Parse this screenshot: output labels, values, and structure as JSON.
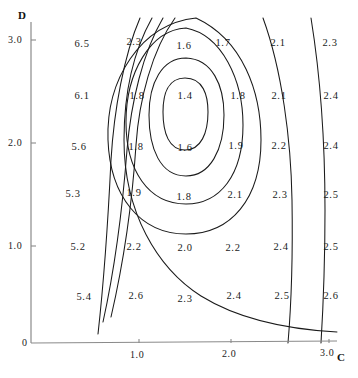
{
  "figure": {
    "type": "contour-plot",
    "background_color": "#ffffff",
    "line_color": "#1a1a1a",
    "axis_color": "#8a8a8a",
    "text_color": "#1b1b1b"
  },
  "axes": {
    "x": {
      "name": "C",
      "name_x": 337,
      "name_y": 352,
      "line": {
        "x1": 31,
        "y1": 343,
        "x2": 337,
        "y2": 341
      },
      "ticks": [
        {
          "label": "1.0",
          "x": 130,
          "y": 350
        },
        {
          "label": "2.0",
          "x": 222,
          "y": 349
        },
        {
          "label": "3.0",
          "x": 320,
          "y": 348
        }
      ]
    },
    "y": {
      "name": "D",
      "name_x": 18,
      "name_y": 10,
      "line": {
        "x1": 31,
        "y1": 22,
        "x2": 31,
        "y2": 343
      },
      "ticks": [
        {
          "label": "3.0",
          "x": 8,
          "y": 35
        },
        {
          "label": "2.0",
          "x": 8,
          "y": 138
        },
        {
          "label": "1.0",
          "x": 8,
          "y": 241
        },
        {
          "label": "0",
          "x": 22,
          "y": 338
        }
      ]
    }
  },
  "chart_data": {
    "type": "contour",
    "title": "",
    "xlabel": "C",
    "ylabel": "D",
    "xlim": [
      0,
      3.1
    ],
    "ylim": [
      0,
      3.1
    ],
    "grid": false,
    "legend": "none",
    "contour_levels": [
      1.4,
      1.6,
      1.8,
      2.0,
      2.3,
      5.2,
      5.6,
      6.1
    ],
    "minimum_value": 1.4,
    "minimum_at": {
      "C": 1.52,
      "D": 2.26
    },
    "value_labels": [
      {
        "text": "6.5",
        "x": 82,
        "y": 44,
        "C": 0.52,
        "D": 2.9
      },
      {
        "text": "2.3",
        "x": 134,
        "y": 42,
        "C": 1.07,
        "D": 2.92
      },
      {
        "text": "1.6",
        "x": 184,
        "y": 46,
        "C": 1.58,
        "D": 2.88
      },
      {
        "text": "1.7",
        "x": 223,
        "y": 43,
        "C": 1.98,
        "D": 2.91
      },
      {
        "text": "2.1",
        "x": 278,
        "y": 43,
        "C": 2.53,
        "D": 2.91
      },
      {
        "text": "2.3",
        "x": 330,
        "y": 43,
        "C": 3.06,
        "D": 2.91
      },
      {
        "text": "6.1",
        "x": 82,
        "y": 96,
        "C": 0.52,
        "D": 2.4
      },
      {
        "text": "1.8",
        "x": 137,
        "y": 96,
        "C": 1.1,
        "D": 2.4
      },
      {
        "text": "1.4",
        "x": 185,
        "y": 96,
        "C": 1.59,
        "D": 2.4
      },
      {
        "text": "1.8",
        "x": 238,
        "y": 96,
        "C": 2.12,
        "D": 2.4
      },
      {
        "text": "2.1",
        "x": 279,
        "y": 96,
        "C": 2.54,
        "D": 2.4
      },
      {
        "text": "2.4",
        "x": 331,
        "y": 96,
        "C": 3.07,
        "D": 2.4
      },
      {
        "text": "5.6",
        "x": 79,
        "y": 147,
        "C": 0.49,
        "D": 1.9
      },
      {
        "text": "1.8",
        "x": 136,
        "y": 147,
        "C": 1.09,
        "D": 1.9
      },
      {
        "text": "1.6",
        "x": 185,
        "y": 148,
        "C": 1.59,
        "D": 1.89
      },
      {
        "text": "1.9",
        "x": 236,
        "y": 146,
        "C": 2.1,
        "D": 1.91
      },
      {
        "text": "2.2",
        "x": 279,
        "y": 146,
        "C": 2.54,
        "D": 1.91
      },
      {
        "text": "2.4",
        "x": 331,
        "y": 146,
        "C": 3.07,
        "D": 1.91
      },
      {
        "text": "5.3",
        "x": 73,
        "y": 194,
        "C": 0.43,
        "D": 1.45
      },
      {
        "text": "1.9",
        "x": 134,
        "y": 193,
        "C": 1.07,
        "D": 1.46
      },
      {
        "text": "1.8",
        "x": 184,
        "y": 197,
        "C": 1.58,
        "D": 1.42
      },
      {
        "text": "2.1",
        "x": 235,
        "y": 195,
        "C": 2.09,
        "D": 1.44
      },
      {
        "text": "2.3",
        "x": 280,
        "y": 195,
        "C": 2.55,
        "D": 1.44
      },
      {
        "text": "2.5",
        "x": 331,
        "y": 195,
        "C": 3.07,
        "D": 1.44
      },
      {
        "text": "5.2",
        "x": 78,
        "y": 247,
        "C": 0.48,
        "D": 0.93
      },
      {
        "text": "2.2",
        "x": 134,
        "y": 247,
        "C": 1.07,
        "D": 0.93
      },
      {
        "text": "2.0",
        "x": 185,
        "y": 248,
        "C": 1.59,
        "D": 0.92
      },
      {
        "text": "2.2",
        "x": 233,
        "y": 248,
        "C": 2.07,
        "D": 0.92
      },
      {
        "text": "2.4",
        "x": 281,
        "y": 247,
        "C": 2.56,
        "D": 0.93
      },
      {
        "text": "2.5",
        "x": 331,
        "y": 247,
        "C": 3.07,
        "D": 0.93
      },
      {
        "text": "5.4",
        "x": 84,
        "y": 297,
        "C": 0.54,
        "D": 0.45
      },
      {
        "text": "2.6",
        "x": 136,
        "y": 296,
        "C": 1.09,
        "D": 0.46
      },
      {
        "text": "2.3",
        "x": 185,
        "y": 299,
        "C": 1.59,
        "D": 0.43
      },
      {
        "text": "2.4",
        "x": 234,
        "y": 296,
        "C": 2.08,
        "D": 0.46
      },
      {
        "text": "2.5",
        "x": 282,
        "y": 296,
        "C": 2.57,
        "D": 0.46
      },
      {
        "text": "2.6",
        "x": 331,
        "y": 296,
        "C": 3.07,
        "D": 0.46
      }
    ],
    "contour_paths": [
      {
        "level": 1.4,
        "d": "M 185 78 C 203 78 208 95 208 112 C 208 133 201 150 185 150 C 169 150 163 133 163 112 C 163 94 168 78 185 78 Z"
      },
      {
        "level": 1.6,
        "d": "M 186 58 C 212 59 224 85 224 115 C 224 150 210 176 186 176 C 160 176 149 148 149 115 C 149 83 162 58 186 58 Z"
      },
      {
        "level": 1.8,
        "d": "M 186 28 C 222 35 243 80 243 125 C 243 175 220 204 186 204 C 148 204 126 170 126 122 C 126 73 150 30 186 28 Z"
      },
      {
        "level": 2.0,
        "d": "M 196 18 C 243 40 261 92 261 140 C 261 199 231 234 186 234 C 140 234 110 196 108 140 C 106 80 140 24 196 18"
      },
      {
        "level": 2.3,
        "d": "M 152 18 C 133 52 124 95 124 140 C 124 212 157 268 201 296 C 235 317 281 329 337 332"
      },
      {
        "level": 5.2,
        "d": "M 175 18 C 152 50 139 100 136 145 C 132 206 123 265 111 317"
      },
      {
        "level": 5.6,
        "d": "M 163 18 C 143 52 131 102 127 150 C 122 215 114 272 103 322"
      },
      {
        "level": 6.1,
        "d": "M 140 18 C 124 55 114 110 111 160 C 108 222 104 280 98 334"
      },
      {
        "level": 6.5,
        "d": "M 263 18 C 282 70 291 140 292 200 C 293 262 291 308 288 343"
      },
      {
        "level": 6.8,
        "d": "M 311 18 C 321 80 325 150 325 210 C 325 268 323 310 321 343"
      }
    ]
  }
}
